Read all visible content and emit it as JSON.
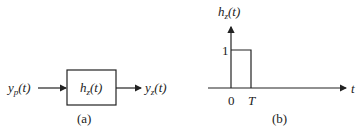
{
  "panel_a": {
    "input_label": {
      "base": "y",
      "sub": "p",
      "arg": "(t)"
    },
    "block_label": {
      "base": "h",
      "sub": "z",
      "arg": "(t)"
    },
    "output_label": {
      "base": "y",
      "sub": "z",
      "arg": "(t)"
    },
    "caption": "(a)"
  },
  "panel_b": {
    "y_axis_label": {
      "base": "h",
      "sub": "z",
      "arg": "(t)"
    },
    "x_axis_label": "t",
    "pulse_height_label": "1",
    "tick_zero": "0",
    "tick_T": "T",
    "caption": "(b)"
  },
  "colors": {
    "stroke": "#222222",
    "background": "#ffffff"
  }
}
